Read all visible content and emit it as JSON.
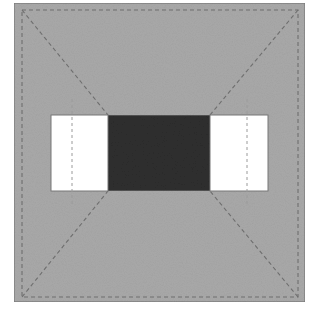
{
  "diagram": {
    "colors": {
      "background": "#ffffff",
      "block_fill": "#a9a9a9",
      "block_border": "#7a7a7a",
      "dash_line": "#6e6e6e",
      "white_panel": "#ffffff",
      "dark_panel": "#2e2e2e",
      "panel_border": "#777777",
      "inner_dash": "#9a9a9a"
    },
    "shapes": {
      "outer_square": {
        "x": 14,
        "y": 3,
        "w": 291,
        "h": 299
      },
      "dashed_border": {
        "x": 22,
        "y": 10,
        "w": 276,
        "h": 287
      },
      "band": {
        "x": 51,
        "y": 115,
        "w": 217,
        "h": 76
      },
      "left_white": {
        "x": 51,
        "y": 115,
        "w": 57,
        "h": 76
      },
      "center_dark": {
        "x": 108,
        "y": 115,
        "w": 102,
        "h": 76
      },
      "right_white": {
        "x": 210,
        "y": 115,
        "w": 58,
        "h": 76
      },
      "left_vertical_dash": {
        "x": 72,
        "y1": 99,
        "y2": 206
      },
      "right_vertical_dash": {
        "x": 247,
        "y1": 99,
        "y2": 206
      }
    }
  }
}
